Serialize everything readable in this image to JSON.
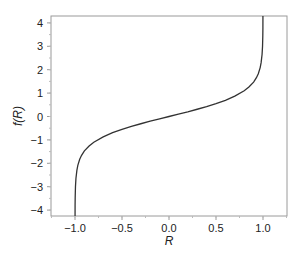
{
  "chart_data": {
    "type": "line",
    "title": "",
    "xlabel": "R",
    "ylabel": "f(R)",
    "xlim": [
      -1.25,
      1.25
    ],
    "ylim": [
      -4.3,
      4.3
    ],
    "grid": false,
    "legend": null,
    "x_ticks": [
      -1.0,
      -0.5,
      0.0,
      0.5,
      1.0
    ],
    "x_tick_labels": [
      "−1.0",
      "−0.5",
      "0.0",
      "0.5",
      "1.0"
    ],
    "y_ticks": [
      -4,
      -3,
      -2,
      -1,
      0,
      1,
      2,
      3,
      4
    ],
    "y_tick_labels": [
      "−4",
      "−3",
      "−2",
      "−1",
      "0",
      "1",
      "2",
      "3",
      "4"
    ],
    "series": [
      {
        "name": "f(R)",
        "color": "#333333",
        "x": [
          -0.9993,
          -0.999,
          -0.998,
          -0.995,
          -0.99,
          -0.98,
          -0.97,
          -0.95,
          -0.93,
          -0.9,
          -0.85,
          -0.8,
          -0.7,
          -0.6,
          -0.5,
          -0.4,
          -0.3,
          -0.2,
          -0.1,
          0.0,
          0.1,
          0.2,
          0.3,
          0.4,
          0.5,
          0.6,
          0.7,
          0.8,
          0.85,
          0.9,
          0.93,
          0.95,
          0.97,
          0.98,
          0.99,
          0.995,
          0.998,
          0.999,
          0.9993
        ],
        "y": [
          -4.3,
          -3.8,
          -3.45,
          -2.99,
          -2.65,
          -2.3,
          -2.09,
          -1.83,
          -1.66,
          -1.47,
          -1.26,
          -1.1,
          -0.87,
          -0.69,
          -0.55,
          -0.42,
          -0.31,
          -0.2,
          -0.1,
          0.0,
          0.1,
          0.2,
          0.31,
          0.42,
          0.55,
          0.69,
          0.87,
          1.1,
          1.26,
          1.47,
          1.66,
          1.83,
          2.09,
          2.3,
          2.65,
          2.99,
          3.45,
          3.8,
          4.3
        ]
      }
    ]
  }
}
